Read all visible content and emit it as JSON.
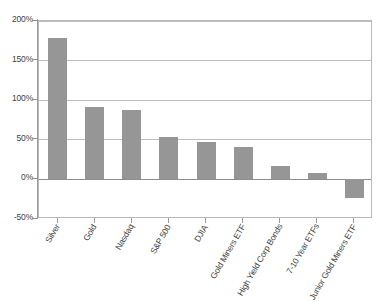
{
  "chart_data": {
    "type": "bar",
    "title": "",
    "subtitle": "",
    "xlabel": "",
    "ylabel": "",
    "categories": [
      "Silver",
      "Gold",
      "Nasdaq",
      "S&P 500",
      "DJIA",
      "Gold Miners ETF",
      "High Yield Corp Bonds",
      "7-10 Year ETFs",
      "Junior Gold Miners ETF"
    ],
    "values": [
      179,
      91,
      88,
      54,
      47,
      41,
      17,
      8,
      -23
    ],
    "value_unit": "%",
    "ylim": [
      -50,
      200
    ],
    "yticks": [
      -50,
      0,
      50,
      100,
      150,
      200
    ],
    "ytick_labels": [
      "-50%",
      "0%",
      "50%",
      "100%",
      "150%",
      "200%"
    ],
    "grid": true,
    "grid_axis": "y",
    "legend": false,
    "legend_position": "none",
    "bar_color": "#969696",
    "gridline_color": "#bdbdbd",
    "axis_color": "#9a9a9a",
    "plot_border_color": "#b9b9b9",
    "background_color": "#ffffff",
    "label_rotation_deg": -60
  }
}
